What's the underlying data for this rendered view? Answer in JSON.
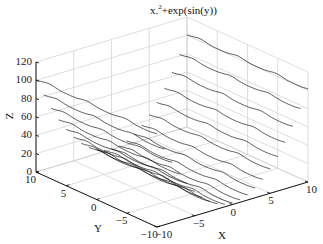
{
  "chart_data": {
    "type": "line3d",
    "title_display": {
      "prefix": "x.",
      "sup": "2",
      "suffix": "+exp(sin(y))"
    },
    "xlabel": "X",
    "ylabel": "Y",
    "zlabel": "Z",
    "xlim": [
      -10,
      10
    ],
    "ylim": [
      -10,
      10
    ],
    "zlim": [
      0,
      120
    ],
    "xticks": [
      -10,
      -5,
      0,
      5,
      10
    ],
    "yticks": [
      -10,
      -5,
      0,
      5,
      10
    ],
    "zticks": [
      0,
      20,
      40,
      60,
      80,
      100,
      120
    ],
    "grid": true,
    "function": "z = x^2 + exp(sin(y))",
    "series_x_values": [
      -10,
      -9,
      -8,
      -7,
      -6,
      -5,
      -4,
      -3,
      -2,
      -1,
      0,
      1,
      2,
      3,
      4,
      5,
      6,
      7,
      8,
      9,
      10
    ],
    "y_range": [
      -10,
      10
    ],
    "y_step": 0.25,
    "line_color": "#000000",
    "grid_color": "#c8c8c8",
    "axis_color": "#000000"
  },
  "labels": {
    "title_prefix": "x.",
    "title_sup": "2",
    "title_suffix": "+exp(sin(y))",
    "x": "X",
    "y": "Y",
    "z": "Z"
  }
}
